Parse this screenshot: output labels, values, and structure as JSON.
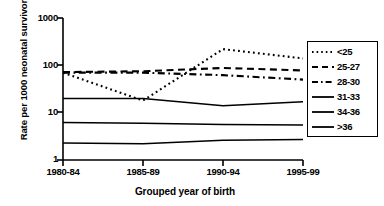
{
  "chart_data": {
    "type": "line",
    "title": "",
    "xlabel": "Grouped year of birth",
    "ylabel": "Rate per 1000 neonatal survivors",
    "categories": [
      "1980-84",
      "1985-89",
      "1990-94",
      "1995-99"
    ],
    "yscale": "log",
    "ylim": [
      1,
      1000
    ],
    "yticks": [
      1,
      10,
      100,
      1000
    ],
    "ytick_labels": [
      "1",
      "10",
      "100",
      "1000"
    ],
    "grid": false,
    "legend_position": "right",
    "series": [
      {
        "name": "<25",
        "style": "dotted",
        "values": [
          70,
          18,
          220,
          140
        ]
      },
      {
        "name": "25-27",
        "style": "dashed",
        "values": [
          72,
          75,
          88,
          78
        ]
      },
      {
        "name": "28-30",
        "style": "dash-dot",
        "values": [
          70,
          70,
          62,
          50
        ]
      },
      {
        "name": "31-33",
        "style": "solid",
        "values": [
          20,
          20,
          14,
          17
        ]
      },
      {
        "name": "34-36",
        "style": "solid",
        "values": [
          6.2,
          6.0,
          5.6,
          5.5
        ]
      },
      {
        "name": ">36",
        "style": "solid",
        "values": [
          2.3,
          2.2,
          2.6,
          2.7
        ]
      }
    ]
  },
  "legend": {
    "entries": [
      {
        "label": "<25"
      },
      {
        "label": "25-27"
      },
      {
        "label": "28-30"
      },
      {
        "label": "31-33"
      },
      {
        "label": "34-36"
      },
      {
        "label": ">36"
      }
    ]
  },
  "axes": {
    "y_title": "Rate per 1000 neonatal survivors",
    "x_title": "Grouped year of birth",
    "y_ticks": [
      "1000",
      "100",
      "10",
      "1"
    ],
    "x_ticks": [
      "1980-84",
      "1985-89",
      "1990-94",
      "1995-99"
    ]
  },
  "colors": {
    "axis": "#000000",
    "series": "#000000",
    "background": "#ffffff"
  }
}
